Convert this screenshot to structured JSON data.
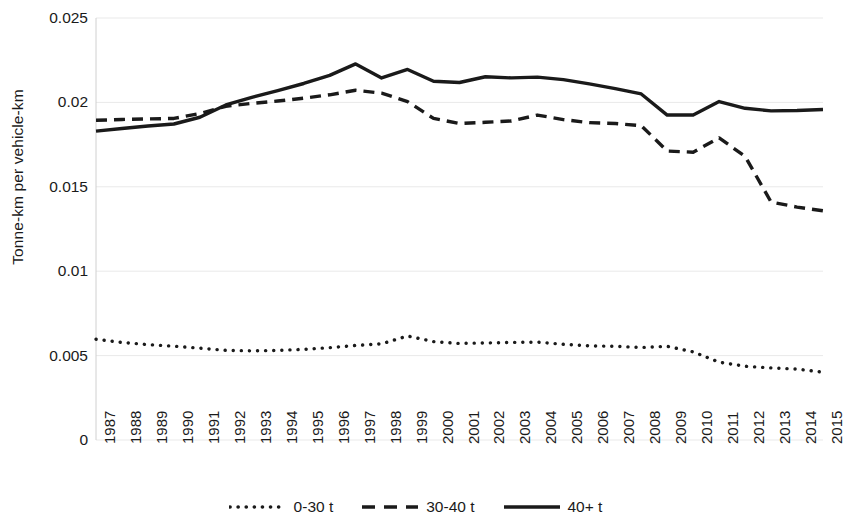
{
  "chart_data": {
    "type": "line",
    "title": "",
    "xlabel": "",
    "ylabel": "Tonne-km per vehicle-km",
    "ylim": [
      0,
      0.025
    ],
    "ytick_labels": [
      "0.025",
      "0.02",
      "0.015",
      "0.01",
      "0.005",
      "0"
    ],
    "ytick_values": [
      0.025,
      0.02,
      0.015,
      0.01,
      0.005,
      0
    ],
    "grid": true,
    "legend_position": "bottom",
    "categories": [
      "1987",
      "1988",
      "1989",
      "1990",
      "1991",
      "1992",
      "1993",
      "1994",
      "1995",
      "1996",
      "1997",
      "1998",
      "1999",
      "2000",
      "2001",
      "2002",
      "2003",
      "2004",
      "2005",
      "2006",
      "2007",
      "2008",
      "2009",
      "2010",
      "2011",
      "2012",
      "2013",
      "2014",
      "2015"
    ],
    "series": [
      {
        "name": "0-30 t",
        "style": "dotted",
        "color": "#1a1a1a",
        "values": [
          0.00597,
          0.00578,
          0.00565,
          0.00556,
          0.00544,
          0.00531,
          0.00528,
          0.00531,
          0.00537,
          0.00547,
          0.0056,
          0.0057,
          0.00616,
          0.00583,
          0.00572,
          0.00575,
          0.00578,
          0.0058,
          0.00567,
          0.00558,
          0.00555,
          0.00548,
          0.00555,
          0.00522,
          0.00461,
          0.00437,
          0.00427,
          0.0042,
          0.00402
        ]
      },
      {
        "name": "30-40 t",
        "style": "dashed",
        "color": "#1a1a1a",
        "values": [
          0.01894,
          0.01899,
          0.01902,
          0.01905,
          0.01934,
          0.01977,
          0.01994,
          0.02008,
          0.02025,
          0.02045,
          0.02072,
          0.02055,
          0.02005,
          0.01905,
          0.01875,
          0.01882,
          0.0189,
          0.01925,
          0.01898,
          0.0188,
          0.01875,
          0.01862,
          0.01712,
          0.01705,
          0.0179,
          0.0168,
          0.0141,
          0.0138,
          0.01358
        ]
      },
      {
        "name": "40+ t",
        "style": "solid",
        "color": "#1a1a1a",
        "values": [
          0.0183,
          0.01845,
          0.0186,
          0.01872,
          0.01912,
          0.01985,
          0.0203,
          0.0207,
          0.02112,
          0.0216,
          0.02228,
          0.02145,
          0.02195,
          0.02125,
          0.02118,
          0.02152,
          0.02145,
          0.0215,
          0.02135,
          0.0211,
          0.02082,
          0.0205,
          0.01925,
          0.01925,
          0.02005,
          0.01965,
          0.0195,
          0.01952,
          0.01958
        ]
      }
    ]
  },
  "legend": {
    "items": [
      {
        "label": "0-30 t",
        "style": "dotted"
      },
      {
        "label": "30-40 t",
        "style": "dashed"
      },
      {
        "label": "40+ t",
        "style": "solid"
      }
    ]
  },
  "axis": {
    "y_title": "Tonne-km per vehicle-km"
  }
}
